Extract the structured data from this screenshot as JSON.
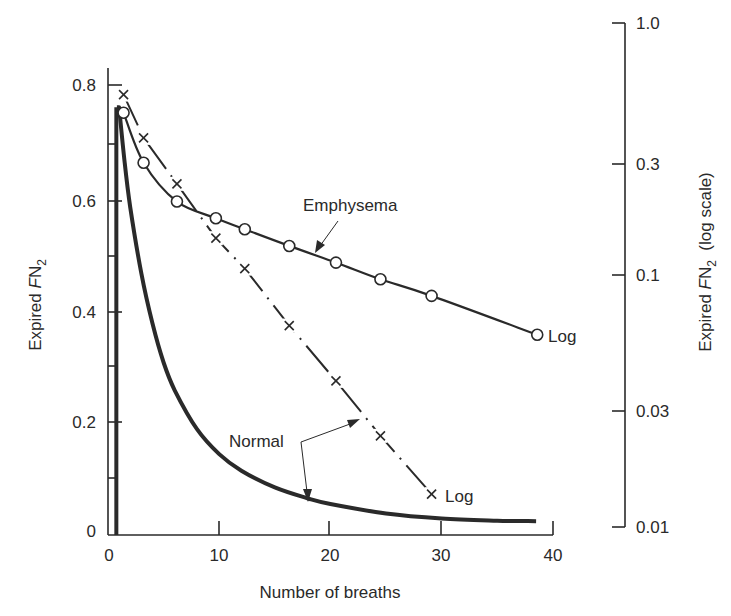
{
  "chart_data": {
    "type": "line",
    "title": "",
    "xlabel": "Number of breaths",
    "ylabel": "Expired FN2",
    "ylabel_right": "Expired FN2 (log scale)",
    "xlim": [
      0,
      40
    ],
    "ylim": [
      0,
      0.8
    ],
    "ylim_right": [
      0.01,
      1.0
    ],
    "grid": false,
    "legend": "none (inline annotations)",
    "x_ticks": [
      "0",
      "10",
      "20",
      "30",
      "40"
    ],
    "y_ticks": [
      "0",
      "0.2",
      "0.4",
      "0.6",
      "0.8"
    ],
    "y_minor_ticks": [
      0.1,
      0.3,
      0.5,
      0.7
    ],
    "y_right_ticks": [
      "0.01",
      "0.03",
      "0.1",
      "0.3",
      "1.0"
    ],
    "series": [
      {
        "name": "Normal (linear)",
        "axis": "left",
        "style": "thick solid line",
        "x": [
          0.8,
          1.0,
          1.5,
          2,
          3,
          4,
          5,
          6,
          8,
          10,
          12,
          15,
          18,
          20,
          25,
          30,
          35,
          38.5
        ],
        "values": [
          0.0,
          0.76,
          0.66,
          0.58,
          0.46,
          0.37,
          0.3,
          0.25,
          0.18,
          0.135,
          0.105,
          0.075,
          0.055,
          0.045,
          0.028,
          0.019,
          0.015,
          0.014
        ]
      },
      {
        "name": "Normal (log)",
        "axis": "right",
        "style": "dash-dot line with x markers",
        "marker": "x",
        "x": [
          1.4,
          3.2,
          6.2,
          9.7,
          12.3,
          16.3,
          20.5,
          24.5,
          29.1
        ],
        "values": [
          0.52,
          0.35,
          0.23,
          0.14,
          0.106,
          0.063,
          0.038,
          0.023,
          0.0135
        ]
      },
      {
        "name": "Emphysema (log)",
        "axis": "right",
        "style": "solid line with open circle markers",
        "marker": "o",
        "x": [
          1.4,
          3.2,
          6.2,
          9.7,
          12.3,
          16.3,
          20.5,
          24.5,
          29.1,
          38.6
        ],
        "values_left_axis_reading": [
          0.75,
          0.66,
          0.59,
          0.56,
          0.54,
          0.51,
          0.48,
          0.45,
          0.42,
          0.35
        ]
      }
    ],
    "annotations": [
      {
        "text": "Emphysema",
        "target": "circle series"
      },
      {
        "text": "Normal",
        "target": "both normal curves (two arrows)"
      },
      {
        "text": "Log",
        "target": "end of emphysema circle series"
      },
      {
        "text": "Log",
        "target": "end of normal x series"
      }
    ]
  },
  "labels": {
    "x_axis_title": "Number of breaths",
    "y_left_title_main": "Expired ",
    "y_left_title_F": "F",
    "y_left_title_N": "N",
    "y_left_title_sub": "2",
    "y_right_title_main": "Expired ",
    "y_right_title_F": "F",
    "y_right_title_N": "N",
    "y_right_title_sub": "2",
    "y_right_title_suffix": "  (log scale)",
    "emphysema": "Emphysema",
    "normal": "Normal",
    "log_emphysema": "Log",
    "log_normal": "Log"
  },
  "colors": {
    "ink": "#2a2a2a",
    "background": "#ffffff"
  }
}
